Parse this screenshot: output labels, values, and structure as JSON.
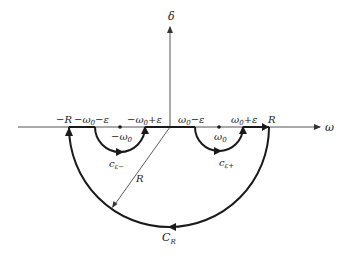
{
  "diagram": {
    "type": "contour-integration-diagram",
    "axes": {
      "horizontal_label": "ω",
      "vertical_label": "δ"
    },
    "axis_labels": {
      "neg_R": "−R",
      "neg_w0_minus_eps": "−ω",
      "neg_w0_minus_eps_tail": "−ε",
      "neg_w0_plus_eps": "−ω",
      "neg_w0_plus_eps_tail": "+ε",
      "w0_minus_eps": "ω",
      "w0_minus_eps_tail": "−ε",
      "w0_plus_eps": "ω",
      "w0_plus_eps_tail": "+ε",
      "pos_R": "R",
      "subscript_zero": "0"
    },
    "poles": {
      "neg_pole_label": "−ω",
      "pos_pole_label": "ω",
      "subscript": "0"
    },
    "contours": {
      "small_left": "c",
      "small_left_sub": "ε−",
      "small_right": "c",
      "small_right_sub": "ε+",
      "large": "C",
      "large_sub": "R"
    },
    "radius_label": "R",
    "colors": {
      "stroke": "#1a1a1a",
      "axis": "#555555",
      "text": "#222222"
    }
  }
}
